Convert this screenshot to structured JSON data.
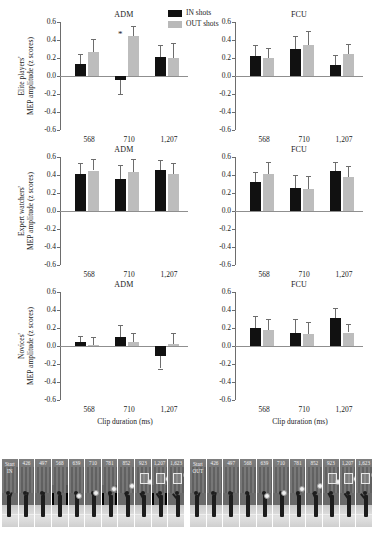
{
  "legend": {
    "items": [
      {
        "label": "IN shots",
        "color": "#111111"
      },
      {
        "label": "OUT shots",
        "color": "#bdbdbd"
      }
    ]
  },
  "columns": [
    {
      "title": "ADM"
    },
    {
      "title": "FCU"
    }
  ],
  "rows": [
    {
      "ylabel_line1": "Elite players'",
      "ylabel_line2": "MEP amplitude (z scores)"
    },
    {
      "ylabel_line1": "Expert watchers'",
      "ylabel_line2": "MEP amplitude (z scores)"
    },
    {
      "ylabel_line1": "Novices'",
      "ylabel_line2": "MEP amplitude (z scores)"
    }
  ],
  "axis": {
    "yticks": [
      "0.6",
      "0.4",
      "0.2",
      "0.0",
      "-0.2",
      "-0.4",
      "-0.6"
    ],
    "ytick_values": [
      0.6,
      0.4,
      0.2,
      0.0,
      -0.2,
      -0.4,
      -0.6
    ],
    "ylim": [
      -0.6,
      0.6
    ],
    "xticks": [
      "568",
      "710",
      "1,207"
    ],
    "xlabel": "Clip duration (ms)"
  },
  "chart_data": [
    {
      "type": "bar",
      "title": "ADM",
      "panel": "Elite players - ADM",
      "xlabel": "Clip duration (ms)",
      "ylabel": "Elite players' MEP amplitude (z scores)",
      "categories": [
        "568",
        "710",
        "1,207"
      ],
      "ylim": [
        -0.6,
        0.6
      ],
      "grid": false,
      "legend_position": "top-center",
      "series": [
        {
          "name": "IN shots",
          "color": "#111111",
          "values": [
            0.13,
            -0.04,
            0.21
          ],
          "errors": [
            0.12,
            0.16,
            0.13
          ]
        },
        {
          "name": "OUT shots",
          "color": "#bdbdbd",
          "values": [
            0.27,
            0.44,
            0.2
          ],
          "errors": [
            0.14,
            0.12,
            0.17
          ]
        }
      ],
      "annotations": [
        {
          "text": "*",
          "category": "710",
          "series": "IN shots"
        }
      ]
    },
    {
      "type": "bar",
      "title": "FCU",
      "panel": "Elite players - FCU",
      "xlabel": "Clip duration (ms)",
      "ylabel": "Elite players' MEP amplitude (z scores)",
      "categories": [
        "568",
        "710",
        "1,207"
      ],
      "ylim": [
        -0.6,
        0.6
      ],
      "grid": false,
      "series": [
        {
          "name": "IN shots",
          "color": "#111111",
          "values": [
            0.22,
            0.3,
            0.12
          ],
          "errors": [
            0.12,
            0.15,
            0.11
          ]
        },
        {
          "name": "OUT shots",
          "color": "#bdbdbd",
          "values": [
            0.2,
            0.35,
            0.24
          ],
          "errors": [
            0.11,
            0.15,
            0.12
          ]
        }
      ],
      "annotations": []
    },
    {
      "type": "bar",
      "title": "ADM",
      "panel": "Expert watchers - ADM",
      "xlabel": "Clip duration (ms)",
      "ylabel": "Expert watchers' MEP amplitude (z scores)",
      "categories": [
        "568",
        "710",
        "1,207"
      ],
      "ylim": [
        -0.6,
        0.6
      ],
      "grid": false,
      "series": [
        {
          "name": "IN shots",
          "color": "#111111",
          "values": [
            0.41,
            0.36,
            0.46
          ],
          "errors": [
            0.12,
            0.15,
            0.11
          ]
        },
        {
          "name": "OUT shots",
          "color": "#bdbdbd",
          "values": [
            0.45,
            0.43,
            0.41
          ],
          "errors": [
            0.13,
            0.15,
            0.12
          ]
        }
      ],
      "annotations": []
    },
    {
      "type": "bar",
      "title": "FCU",
      "panel": "Expert watchers - FCU",
      "xlabel": "Clip duration (ms)",
      "ylabel": "Expert watchers' MEP amplitude (z scores)",
      "categories": [
        "568",
        "710",
        "1,207"
      ],
      "ylim": [
        -0.6,
        0.6
      ],
      "grid": false,
      "series": [
        {
          "name": "IN shots",
          "color": "#111111",
          "values": [
            0.32,
            0.26,
            0.45
          ],
          "errors": [
            0.11,
            0.14,
            0.1
          ]
        },
        {
          "name": "OUT shots",
          "color": "#bdbdbd",
          "values": [
            0.41,
            0.24,
            0.38
          ],
          "errors": [
            0.13,
            0.15,
            0.12
          ]
        }
      ],
      "annotations": []
    },
    {
      "type": "bar",
      "title": "ADM",
      "panel": "Novices - ADM",
      "xlabel": "Clip duration (ms)",
      "ylabel": "Novices' MEP amplitude (z scores)",
      "categories": [
        "568",
        "710",
        "1,207"
      ],
      "ylim": [
        -0.6,
        0.6
      ],
      "grid": false,
      "series": [
        {
          "name": "IN shots",
          "color": "#111111",
          "values": [
            0.04,
            0.1,
            -0.11
          ],
          "errors": [
            0.07,
            0.13,
            0.14
          ]
        },
        {
          "name": "OUT shots",
          "color": "#bdbdbd",
          "values": [
            0.01,
            0.04,
            0.02
          ],
          "errors": [
            0.09,
            0.1,
            0.12
          ]
        }
      ],
      "annotations": []
    },
    {
      "type": "bar",
      "title": "FCU",
      "panel": "Novices - FCU",
      "xlabel": "Clip duration (ms)",
      "ylabel": "Novices' MEP amplitude (z scores)",
      "categories": [
        "568",
        "710",
        "1,207"
      ],
      "ylim": [
        -0.6,
        0.6
      ],
      "grid": false,
      "series": [
        {
          "name": "IN shots",
          "color": "#111111",
          "values": [
            0.2,
            0.15,
            0.31
          ],
          "errors": [
            0.13,
            0.15,
            0.11
          ]
        },
        {
          "name": "OUT shots",
          "color": "#bdbdbd",
          "values": [
            0.18,
            0.13,
            0.15
          ],
          "errors": [
            0.12,
            0.14,
            0.09
          ]
        }
      ],
      "annotations": []
    }
  ],
  "filmstrips": [
    {
      "name": "IN",
      "start_label_line1": "Start",
      "start_label_line2": "IN",
      "frames": [
        "426",
        "497",
        "568",
        "639",
        "710",
        "781",
        "852",
        "923",
        "1,207",
        "1,623"
      ],
      "highlighted": [
        "568",
        "781",
        "1,207"
      ]
    },
    {
      "name": "OUT",
      "start_label_line1": "Start",
      "start_label_line2": "OUT",
      "frames": [
        "426",
        "497",
        "568",
        "639",
        "710",
        "781",
        "852",
        "923",
        "1,207",
        "1,623"
      ],
      "highlighted": []
    }
  ]
}
